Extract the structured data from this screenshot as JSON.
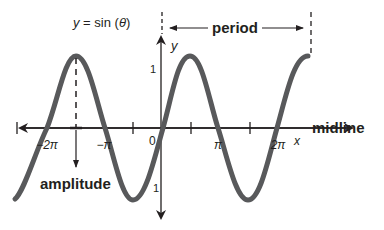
{
  "title": {
    "prefix": "y",
    "eq": " = sin (",
    "theta": "θ",
    "suffix": ")"
  },
  "axes": {
    "x_label": "x",
    "y_label": "y",
    "midline_label": "midline",
    "y_tick_top": "1",
    "y_tick_bottom": "1",
    "origin": "0"
  },
  "x_ticks": [
    "−2π",
    "−π",
    "π",
    "2π"
  ],
  "annotations": {
    "period": "period",
    "amplitude": "amplitude"
  },
  "colors": {
    "curve": "#58595b",
    "ink": "#231f20"
  }
}
